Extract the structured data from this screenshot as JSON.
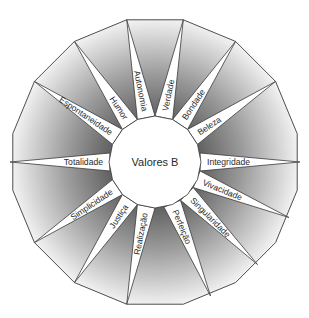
{
  "diagram": {
    "title": "Valores B",
    "center": {
      "x": 155,
      "y": 162
    },
    "outer_radius": 145,
    "inner_radius": 46,
    "colors": {
      "stroke": "#3a3a3a",
      "shade_dark": "#6a6a6a",
      "shade_light": "#ffffff",
      "spike_fill": "#ffffff",
      "text": "#2a2a2a"
    },
    "values": [
      {
        "label": "Verdade"
      },
      {
        "label": "Bondade"
      },
      {
        "label": "Beleza"
      },
      {
        "label": "Integridade"
      },
      {
        "label": "Vivacidade"
      },
      {
        "label": "Singularidade"
      },
      {
        "label": "Perfeição"
      },
      {
        "label": "Realização"
      },
      {
        "label": "Justiça"
      },
      {
        "label": "Simplicidade"
      },
      {
        "label": "Totalidade"
      },
      {
        "label": "Espontaneidade"
      },
      {
        "label": "Humor"
      },
      {
        "label": "Autonomia"
      }
    ]
  }
}
